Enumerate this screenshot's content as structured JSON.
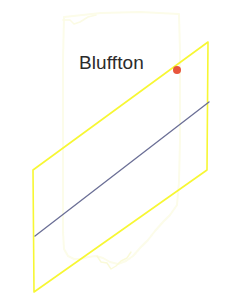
{
  "figure": {
    "type": "locator-map",
    "width": 231,
    "height": 299,
    "background_color": "#ffffff"
  },
  "label": {
    "place_name": "Bluffton"
  },
  "marker": {
    "name": "place-marker",
    "color": "#e8553c",
    "x": 177,
    "y": 70,
    "radius": 4
  },
  "layers": {
    "state_outline": {
      "name": "state-boundary",
      "color": "#fbfbe8",
      "stroke_width": 2,
      "description": "faint state outline"
    },
    "quadrangle": {
      "name": "quadrangle-boundary",
      "color": "#f7f733",
      "stroke_width": 1.6,
      "shape": "parallelogram",
      "corners": [
        {
          "x": 208,
          "y": 42
        },
        {
          "x": 207,
          "y": 170
        },
        {
          "x": 34,
          "y": 292
        },
        {
          "x": 33,
          "y": 170
        }
      ]
    },
    "river": {
      "name": "river-line",
      "color": "#6b6f96",
      "stroke_width": 1.3,
      "from": {
        "x": 35,
        "y": 236
      },
      "to": {
        "x": 209,
        "y": 102
      }
    }
  }
}
